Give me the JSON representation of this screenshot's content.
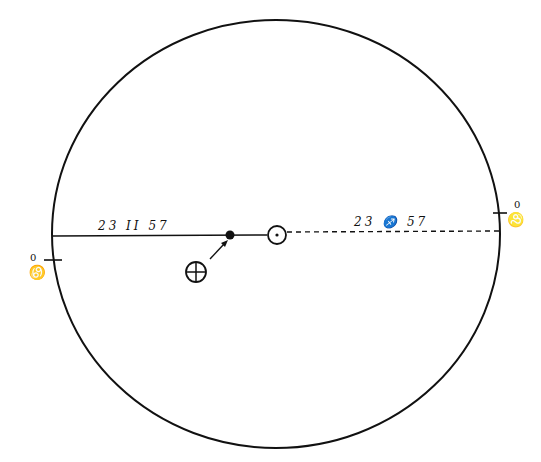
{
  "diagram": {
    "type": "orbital-diagram",
    "orbit_circle": {
      "cx": 276,
      "cy": 234,
      "rx": 224,
      "ry": 214
    },
    "baseline_y": 235,
    "labels": {
      "left_segment": "23 II 57",
      "right_segment": "23 ♐ 57",
      "right_tick_sign": "♌",
      "right_tick_degree": "0",
      "left_tick_sign": "♋",
      "left_tick_degree": "0"
    },
    "symbols": {
      "sun": "☉",
      "earth": "⊕",
      "point": "●"
    },
    "colors": {
      "ink": "#111111",
      "paper": "#ffffff"
    }
  }
}
